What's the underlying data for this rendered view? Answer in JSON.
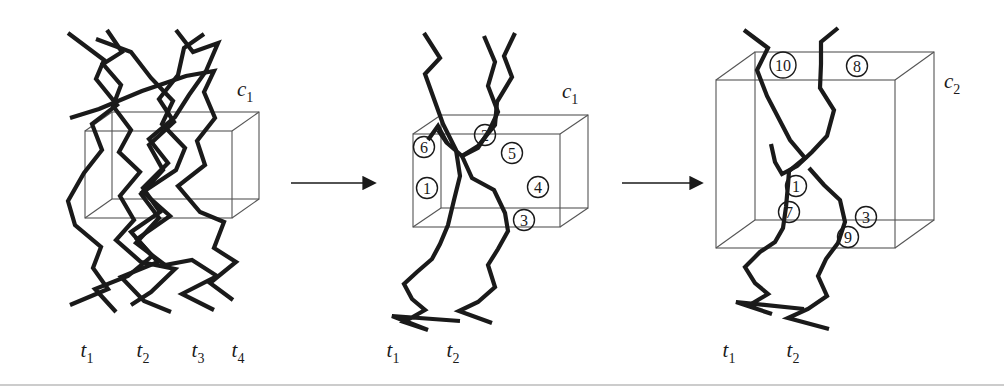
{
  "figure": {
    "type": "diagram",
    "background_color": "#ffffff",
    "line_color": "#1a1a1a",
    "box_color": "#555555",
    "panel_count": 3,
    "arrow_count": 2
  },
  "panels": [
    {
      "id": "panel-1",
      "cluster_label": "c",
      "cluster_sub": "1",
      "cluster_label_x": 237,
      "cluster_label_y": 96,
      "time_labels": [
        {
          "base": "t",
          "sub": "1",
          "x": 87,
          "y": 357
        },
        {
          "base": "t",
          "sub": "2",
          "x": 143,
          "y": 357
        },
        {
          "base": "t",
          "sub": "3",
          "x": 198,
          "y": 357
        },
        {
          "base": "t",
          "sub": "4",
          "x": 238,
          "y": 357
        }
      ],
      "box": {
        "front_left": 85,
        "front_right": 232,
        "front_top": 131,
        "front_bottom": 218,
        "depth_x": 27,
        "depth_y": -19
      },
      "tracks": [
        {
          "id": "track-a",
          "bold": true,
          "points": "68,33 104,60 96,79 117,105 92,124 102,150 84,173 68,201 75,225 101,247 93,268 108,289 70,305"
        },
        {
          "id": "track-b",
          "bold": true,
          "points": "107,30 122,52 103,64 121,85 113,106 131,130 119,152 140,172 120,196 134,220 116,240 141,262 175,269 151,292 131,305"
        },
        {
          "id": "track-c",
          "bold": true,
          "points": "96,39 131,52 151,78 173,101 162,124 185,148 176,170 143,192 170,216 137,239 158,262 121,277 144,301 171,312"
        },
        {
          "id": "track-d",
          "bold": true,
          "points": "176,30 193,52 218,43 206,71 189,95 175,117 149,139 168,163 143,188 160,212 131,232 152,256 128,276 95,289 116,312"
        },
        {
          "id": "track-e",
          "bold": true,
          "points": "204,34 184,48 178,75 159,99 174,122 149,145 163,170 141,194 159,218 136,243 165,265 192,260 217,276 182,294 214,310"
        },
        {
          "id": "track-f",
          "bold": true,
          "points": "70,118 99,109 142,91 186,76 214,71 204,92 215,118 197,141 205,165 178,186 200,212 224,222 214,248 236,262 210,283 233,300"
        }
      ],
      "circles": []
    },
    {
      "id": "panel-2",
      "cluster_label": "c",
      "cluster_sub": "1",
      "cluster_label_x": 562,
      "cluster_label_y": 98,
      "time_labels": [
        {
          "base": "t",
          "sub": "1",
          "x": 393,
          "y": 357
        },
        {
          "base": "t",
          "sub": "2",
          "x": 453,
          "y": 357
        }
      ],
      "box": {
        "front_left": 413,
        "front_right": 560,
        "front_top": 134,
        "front_bottom": 227,
        "depth_x": 28,
        "depth_y": -19
      },
      "tracks": [
        {
          "id": "track-1",
          "bold": true,
          "points": "424,33 440,58 425,74 434,99 443,124 456,150 460,176 454,200 448,225 440,244 432,259 417,272 404,284 412,299 425,310 404,322 428,330 392,316 460,321"
        },
        {
          "id": "track-2",
          "bold": true,
          "points": "515,33 504,56 512,77 497,102 495,125 478,146 462,156 447,143 438,126 428,140"
        },
        {
          "id": "track-3",
          "bold": true,
          "points": "484,36 495,62 488,86 498,112 489,131 478,148 462,156 472,178 494,190 505,213 508,231 498,249 488,265 495,287 478,302 459,311 492,323"
        },
        {
          "id": "track-6",
          "bold": true,
          "points": "438,130 447,143"
        }
      ],
      "circles": [
        {
          "n": "6",
          "x": 424,
          "y": 147
        },
        {
          "n": "2",
          "x": 485,
          "y": 135
        },
        {
          "n": "5",
          "x": 512,
          "y": 153
        },
        {
          "n": "1",
          "x": 427,
          "y": 188
        },
        {
          "n": "4",
          "x": 538,
          "y": 187
        },
        {
          "n": "3",
          "x": 524,
          "y": 220
        }
      ]
    },
    {
      "id": "panel-3",
      "cluster_label": "c",
      "cluster_sub": "2",
      "cluster_label_x": 944,
      "cluster_label_y": 88,
      "time_labels": [
        {
          "base": "t",
          "sub": "1",
          "x": 729,
          "y": 357
        },
        {
          "base": "t",
          "sub": "2",
          "x": 793,
          "y": 357
        }
      ],
      "box": {
        "front_left": 716,
        "front_right": 895,
        "front_top": 80,
        "front_bottom": 248,
        "depth_x": 39,
        "depth_y": -28
      },
      "tracks": [
        {
          "id": "track-10",
          "bold": true,
          "points": "744,30 768,48 757,70 767,96 790,140 805,158 789,171 788,185 786,207 783,228 775,242 760,252 745,267 755,283 768,294 748,306 772,314 736,302 804,309"
        },
        {
          "id": "track-8",
          "bold": true,
          "points": "838,28 821,42 821,64 820,88 834,110 827,136 812,152 797,166 782,174 775,162 771,144"
        },
        {
          "id": "track-9",
          "bold": true,
          "points": "809,168 824,185 840,200 845,222 838,243 826,259 818,276 827,296 808,309 788,318 829,329"
        }
      ],
      "circles": [
        {
          "n": "10",
          "x": 783,
          "y": 65
        },
        {
          "n": "8",
          "x": 857,
          "y": 66
        },
        {
          "n": "1",
          "x": 796,
          "y": 186
        },
        {
          "n": "7",
          "x": 789,
          "y": 212
        },
        {
          "n": "3",
          "x": 866,
          "y": 217
        },
        {
          "n": "9",
          "x": 848,
          "y": 237
        }
      ]
    }
  ],
  "arrows": [
    {
      "id": "arrow-1",
      "x1": 291,
      "x2": 373,
      "y": 183
    },
    {
      "id": "arrow-2",
      "x1": 622,
      "x2": 700,
      "y": 183
    }
  ],
  "footer_rule": {
    "x1": 0,
    "x2": 1004,
    "y": 385
  }
}
